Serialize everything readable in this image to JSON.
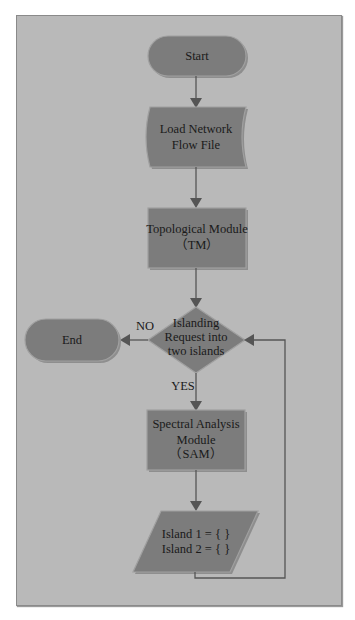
{
  "diagram": {
    "type": "flowchart",
    "colors": {
      "background": "#b9b9b9",
      "node_fill": "#7c7c7c",
      "connector": "#555555",
      "text": "#1a1a1a"
    },
    "nodes": {
      "start": {
        "shape": "terminator",
        "label": "Start"
      },
      "load": {
        "shape": "document",
        "line1": "Load Network",
        "line2": "Flow File"
      },
      "tm": {
        "shape": "process",
        "line1": "Topological Module",
        "line2": "（TM）"
      },
      "decision": {
        "shape": "decision",
        "line1": "Islanding",
        "line2": "Request into",
        "line3": "two islands"
      },
      "end": {
        "shape": "terminator",
        "label": "End"
      },
      "sam": {
        "shape": "process",
        "line1": "Spectral Analysis",
        "line2": "Module",
        "line3": "（SAM）"
      },
      "islands": {
        "shape": "data",
        "line1": "Island 1 = { }",
        "line2": "Island 2 = { }"
      }
    },
    "edges": {
      "no_label": "NO",
      "yes_label": "YES"
    }
  }
}
